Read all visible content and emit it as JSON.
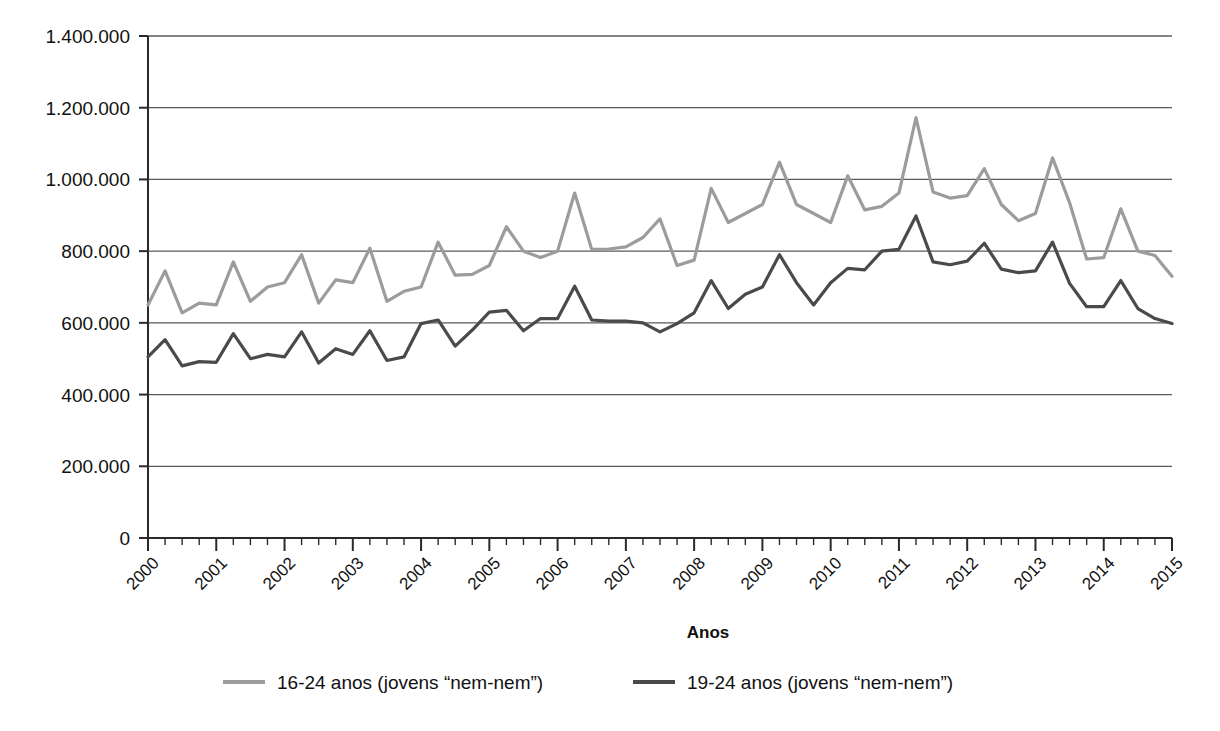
{
  "chart_data": {
    "type": "line",
    "title": "",
    "xlabel": "Anos",
    "ylabel": "",
    "ylim": [
      0,
      1400000
    ],
    "ytick_labels": [
      "0",
      "200.000",
      "400.000",
      "600.000",
      "800.000",
      "1.000.000",
      "1.200.000",
      "1.400.000"
    ],
    "ytick_values": [
      0,
      200000,
      400000,
      600000,
      800000,
      1000000,
      1200000,
      1400000
    ],
    "xtick_labels": [
      "2000",
      "2001",
      "2002",
      "2003",
      "2004",
      "2005",
      "2006",
      "2007",
      "2008",
      "2009",
      "2010",
      "2011",
      "2012",
      "2013",
      "2014",
      "2015"
    ],
    "xlim": [
      2000,
      2015
    ],
    "x_minor_ticks_per_year": 4,
    "grid": true,
    "legend_position": "bottom",
    "legend": [
      {
        "label": "16-24 anos (jovens “nem-nem”)",
        "color": "#9c9c9c"
      },
      {
        "label": "19-24 anos (jovens “nem-nem”)",
        "color": "#4a4a4a"
      }
    ],
    "x": [
      2000.0,
      2000.25,
      2000.5,
      2000.75,
      2001.0,
      2001.25,
      2001.5,
      2001.75,
      2002.0,
      2002.25,
      2002.5,
      2002.75,
      2003.0,
      2003.25,
      2003.5,
      2003.75,
      2004.0,
      2004.25,
      2004.5,
      2004.75,
      2005.0,
      2005.25,
      2005.5,
      2005.75,
      2006.0,
      2006.25,
      2006.5,
      2006.75,
      2007.0,
      2007.25,
      2007.5,
      2007.75,
      2008.0,
      2008.25,
      2008.5,
      2008.75,
      2009.0,
      2009.25,
      2009.5,
      2009.75,
      2010.0,
      2010.25,
      2010.5,
      2010.75,
      2011.0,
      2011.25,
      2011.5,
      2011.75,
      2012.0,
      2012.25,
      2012.5,
      2012.75,
      2013.0,
      2013.25,
      2013.5,
      2013.75,
      2014.0,
      2014.25,
      2014.5,
      2014.75,
      2015.0
    ],
    "series": [
      {
        "name": "16-24 anos (jovens “nem-nem”)",
        "color": "#9c9c9c",
        "values": [
          650000,
          745000,
          628000,
          655000,
          650000,
          770000,
          660000,
          700000,
          712000,
          790000,
          655000,
          720000,
          712000,
          808000,
          660000,
          688000,
          700000,
          825000,
          733000,
          735000,
          760000,
          868000,
          800000,
          782000,
          800000,
          962000,
          805000,
          806000,
          812000,
          838000,
          890000,
          760000,
          775000,
          975000,
          880000,
          905000,
          930000,
          1048000,
          930000,
          905000,
          880000,
          1010000,
          915000,
          925000,
          962000,
          1172000,
          965000,
          948000,
          955000,
          1030000,
          930000,
          885000,
          905000,
          1060000,
          935000,
          778000,
          782000,
          918000,
          800000,
          788000,
          730000
        ]
      },
      {
        "name": "19-24 anos (jovens “nem-nem”)",
        "color": "#4a4a4a",
        "values": [
          505000,
          553000,
          480000,
          492000,
          490000,
          570000,
          500000,
          512000,
          505000,
          575000,
          488000,
          528000,
          512000,
          578000,
          495000,
          505000,
          598000,
          608000,
          535000,
          580000,
          630000,
          635000,
          578000,
          612000,
          612000,
          702000,
          608000,
          605000,
          605000,
          600000,
          575000,
          598000,
          628000,
          718000,
          640000,
          680000,
          700000,
          790000,
          712000,
          650000,
          712000,
          752000,
          748000,
          800000,
          805000,
          898000,
          770000,
          762000,
          772000,
          822000,
          750000,
          740000,
          745000,
          825000,
          710000,
          645000,
          645000,
          718000,
          640000,
          612000,
          598000
        ]
      }
    ]
  }
}
